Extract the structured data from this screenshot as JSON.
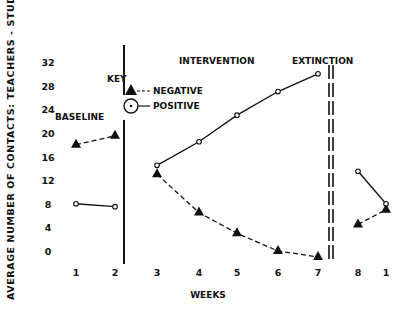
{
  "chart_data": {
    "type": "line",
    "title": "",
    "xlabel": "WEEKS",
    "ylabel": "AVERAGE NUMBER OF CONTACTS: TEACHERS - STUDENTS",
    "yticks": [
      0,
      4,
      8,
      12,
      16,
      20,
      24,
      28,
      32
    ],
    "ylim": [
      0,
      32
    ],
    "x_tick_labels": [
      "1",
      "2",
      "3",
      "4",
      "5",
      "6",
      "7",
      "8",
      "1"
    ],
    "grid": false,
    "phases": [
      "BASELINE",
      "INTERVENTION",
      "EXTINCTION"
    ],
    "legend": {
      "title": "KEY",
      "entries": [
        {
          "name": "NEGATIVE",
          "marker": "filled-triangle",
          "line": "dashed"
        },
        {
          "name": "POSITIVE",
          "marker": "open-circle",
          "line": "solid"
        }
      ],
      "position": "upper-left (between baseline and intervention)"
    },
    "series": [
      {
        "name": "NEGATIVE",
        "segments": [
          {
            "phase": "BASELINE",
            "x": [
              "1",
              "2"
            ],
            "values": [
              18,
              19.5
            ]
          },
          {
            "phase": "INTERVENTION",
            "x": [
              "3",
              "4",
              "5",
              "6",
              "7"
            ],
            "values": [
              13,
              6.5,
              3,
              0,
              -1
            ]
          },
          {
            "phase": "EXTINCTION",
            "x": [
              "8",
              "1"
            ],
            "values": [
              4.5,
              7
            ]
          }
        ]
      },
      {
        "name": "POSITIVE",
        "segments": [
          {
            "phase": "BASELINE",
            "x": [
              "1",
              "2"
            ],
            "values": [
              8,
              7.5
            ]
          },
          {
            "phase": "INTERVENTION",
            "x": [
              "3",
              "4",
              "5",
              "6",
              "7"
            ],
            "values": [
              14.5,
              18.5,
              23,
              27,
              30
            ]
          },
          {
            "phase": "EXTINCTION",
            "x": [
              "8",
              "1"
            ],
            "values": [
              13.5,
              8
            ]
          }
        ]
      }
    ]
  },
  "labels": {
    "key": "KEY",
    "negative": "NEGATIVE",
    "positive": "POSITIVE",
    "baseline": "BASELINE",
    "intervention": "INTERVENTION",
    "extinction": "EXTINCTION",
    "xlabel": "WEEKS",
    "ylabel": "AVERAGE NUMBER OF CONTACTS: TEACHERS - STUDENTS"
  }
}
